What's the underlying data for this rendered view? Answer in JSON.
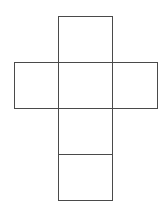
{
  "diagram": {
    "type": "cube-net",
    "line_color": "#4a4a4a",
    "background": "#ffffff",
    "faces": [
      {
        "id": "top",
        "x": 58,
        "y": 16,
        "w": 55,
        "h": 47
      },
      {
        "id": "left",
        "x": 14,
        "y": 62,
        "w": 45,
        "h": 47
      },
      {
        "id": "center",
        "x": 58,
        "y": 62,
        "w": 55,
        "h": 47
      },
      {
        "id": "right",
        "x": 112,
        "y": 62,
        "w": 46,
        "h": 47
      },
      {
        "id": "lower",
        "x": 58,
        "y": 108,
        "w": 55,
        "h": 47
      },
      {
        "id": "bottom",
        "x": 58,
        "y": 154,
        "w": 55,
        "h": 47
      }
    ]
  }
}
